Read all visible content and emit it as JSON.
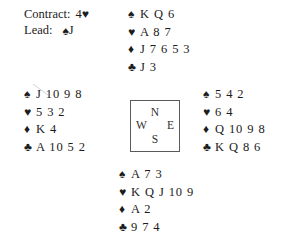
{
  "diagram": {
    "type": "bridge-hand-diagram",
    "background_color": "#ffffff",
    "text_color": "#1c1c1c",
    "suit_symbols_color": "#1c1c1c"
  },
  "info": {
    "contract_label": "Contract:",
    "contract_level": "4",
    "contract_suit_symbol": "♥",
    "contract_suit_name": "hearts",
    "contract_text": "4♥",
    "lead_label": "Lead:",
    "lead_suit_symbol": "♠",
    "lead_suit_name": "spades",
    "lead_rank": "J",
    "lead_text": "♠J"
  },
  "compass": {
    "north": "N",
    "west": "W",
    "east": "E",
    "south": "S"
  },
  "symbols": {
    "spade": "♠",
    "heart": "♥",
    "diamond": "♦",
    "club": "♣"
  },
  "hands": {
    "north": {
      "position": "North",
      "spades": "K Q 6",
      "hearts": "A 8 7",
      "diamonds": "J 7 6 5 3",
      "clubs": "J 3"
    },
    "west": {
      "position": "West",
      "spades": "J 10 9 8",
      "hearts": "5 3 2",
      "diamonds": "K 4",
      "clubs": "A 10 5 2"
    },
    "east": {
      "position": "East",
      "spades": "5 4 2",
      "hearts": "6 4",
      "diamonds": "Q 10 9 8",
      "clubs": "K Q 8 6"
    },
    "south": {
      "position": "South",
      "spades": "A 7 3",
      "hearts": "K Q J 10 9",
      "diamonds": "A 2",
      "clubs": "9 7 4"
    }
  }
}
